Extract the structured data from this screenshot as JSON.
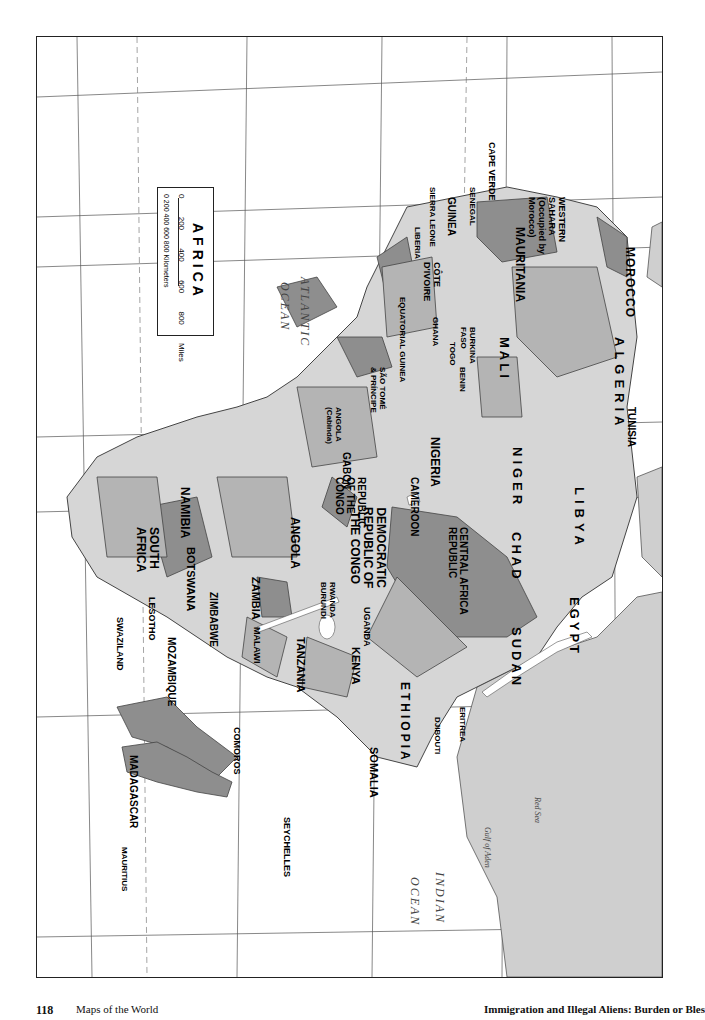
{
  "page": {
    "number": "118",
    "section_title": "Maps of the World",
    "book_title": "Immigration and Illegal Aliens: Burden or Bles"
  },
  "map": {
    "title": "AFRICA",
    "orientation": "rotated 90° clockwise",
    "scale": {
      "miles_ticks": [
        "0",
        "200",
        "400",
        "600",
        "800 Miles"
      ],
      "km_ticks": [
        "0",
        "200",
        "400",
        "600",
        "800 Kilometers"
      ]
    },
    "oceans": {
      "atlantic_1": "ATLANTIC",
      "atlantic_2": "OCEAN",
      "indian_1": "INDIAN",
      "indian_2": "OCEAN"
    },
    "water_bodies": {
      "red_sea": "Red Sea",
      "gulf_of_aden": "Gulf of Aden",
      "mozambique_channel_1": "Mozambique",
      "mozambique_channel_2": "Channel",
      "suez": "Suez Canal",
      "lake_chad": "Lake Chad",
      "lake_victoria": "Lake Victoria",
      "lake_tanganyika": "Lake Tanganyika",
      "lake_malawi": "Lake Malawi",
      "lake_turkana": "Lake Turkana",
      "lake_nasser": "Lake Nasser"
    },
    "lines": {
      "tropic_cancer": "Tropic of Cancer",
      "equator": "Equator",
      "tropic_capricorn": "Tropic of Capricorn"
    },
    "countries": {
      "morocco": "MOROCCO",
      "western_sahara_1": "WESTERN",
      "western_sahara_2": "SAHARA",
      "western_sahara_3": "(Occupied by",
      "western_sahara_4": "Morocco)",
      "algeria": "ALGERIA",
      "tunisia": "TUNISIA",
      "libya": "LIBYA",
      "egypt": "EGYPT",
      "mauritania": "MAURITANIA",
      "mali": "MALI",
      "niger": "NIGER",
      "chad": "CHAD",
      "sudan": "SUDAN",
      "cape_verde": "CAPE VERDE",
      "senegal": "SENEGAL",
      "gambia_1": "THE",
      "gambia_2": "GAMBIA",
      "guinea_bissau_1": "GUINEA-",
      "guinea_bissau_2": "BISSAU",
      "guinea": "GUINEA",
      "sierra_leone": "SIERRA LEONE",
      "liberia": "LIBERIA",
      "cote_divoire_1": "CÔTE",
      "cote_divoire_2": "D'IVOIRE",
      "burkina_1": "BURKINA",
      "burkina_2": "FASO",
      "ghana": "GHANA",
      "togo": "TOGO",
      "benin": "BENIN",
      "nigeria": "NIGERIA",
      "cameroon": "CAMEROON",
      "car_1": "CENTRAL AFRICA",
      "car_2": "REPUBLIC",
      "eq_guinea": "EQUATORIAL GUINEA",
      "sao_tome_1": "SÃO TOMÉ",
      "sao_tome_2": "& PRÍNCIPE",
      "gabon": "GABON",
      "congo_1": "REPUBLIC",
      "congo_2": "OF THE",
      "congo_3": "CONGO",
      "drc_1": "DEMOCRATIC",
      "drc_2": "REPUBLIC OF",
      "drc_3": "THE CONGO",
      "cabinda_1": "ANGOLA",
      "cabinda_2": "(Cabinda)",
      "angola": "ANGOLA",
      "namibia": "NAMIBIA",
      "botswana": "BOTSWANA",
      "zambia": "ZAMBIA",
      "zimbabwe": "ZIMBABWE",
      "malawi": "MALAWI",
      "mozambique": "MOZAMBIQUE",
      "south_africa_1": "SOUTH",
      "south_africa_2": "AFRICA",
      "lesotho": "LESOTHO",
      "swaziland": "SWAZILAND",
      "madagascar": "MADAGASCAR",
      "tanzania": "TANZANIA",
      "kenya": "KENYA",
      "uganda": "UGANDA",
      "rwanda": "RWANDA",
      "burundi": "BURUNDI",
      "ethiopia": "ETHIOPIA",
      "eritrea": "ERITREA",
      "djibouti": "DJIBOUTI",
      "somalia": "SOMALIA",
      "comoros": "COMOROS",
      "seychelles": "SEYCHELLES",
      "mauritius": "MAURITIUS"
    },
    "cities": {
      "rabat": "Rabat",
      "marrakesh": "Marrakesh",
      "oran": "Oran",
      "algiers": "Algiers",
      "tunis": "Tunis",
      "tripoli": "Tripoli",
      "tamanrasset": "Tamanrasset",
      "sebha": "Sebha",
      "al_jawf": "Al Jawf",
      "tobruk": "Tobruk",
      "alexandria": "Alexandria",
      "cairo": "Cairo",
      "aswan": "Aswan",
      "nouakchott": "Nouakchott",
      "nema": "Néma",
      "chegga": "Chegga",
      "smara": "Smara",
      "dakar": "Dakar",
      "banjul": "Banjul",
      "bissau": "Bissau",
      "conakry": "Conakry",
      "freetown": "Freetown",
      "monrovia": "Monrovia",
      "bamako": "Bamako",
      "tombouctou": "Tombouctou",
      "ouagadougou": "Ouagadougou",
      "yamoussoukro": "Yamoussoukro",
      "abidjan": "Abidjan",
      "accra": "Accra",
      "lome": "Lomé",
      "porto_novo": "Porto-Novo",
      "tagalla": "Tagalla",
      "niamey": "Niamey",
      "agadez": "Agadez",
      "zinder": "Zinder",
      "kano": "Kano",
      "maiduguri": "Maiduguri",
      "abuja": "Abuja",
      "faya_largeau": "Faya-Largeau",
      "ndjamena": "N'Djamena",
      "bousso": "Bousso",
      "douala": "Douala",
      "yaounde": "Yaoundé",
      "bangui": "Bangui",
      "birao": "Birao",
      "malabo": "Malabo",
      "bata": "Bata",
      "libreville": "Libreville",
      "sao_tome": "São Tomé",
      "brazzaville": "Brazzaville",
      "kinshasa": "Kinshasa",
      "kisangani": "Kisangani",
      "kananga": "Kananga",
      "lubumbashi": "Lubumbashi",
      "luanda": "Luanda",
      "benguela": "Benguela",
      "lobito": "Lobito",
      "menongue": "Menongue",
      "windhoek": "Windhoek",
      "walvis_bay": "Walvis Bay",
      "luderitz": "Lüderitz",
      "gaborone": "Gaborone",
      "maun": "Maun",
      "lusaka": "Lusaka",
      "kitwe": "Kitwe",
      "harare": "Harare",
      "bulawayo": "Bulawayo",
      "lilongwe": "Lilongwe",
      "pretoria": "Pretoria",
      "johannesburg": "Johannesburg",
      "maseru": "Maseru",
      "mbabane": "Mbabane",
      "maputo": "Maputo",
      "inhambane": "Inhambane",
      "nampula": "Nampula",
      "cape_town": "Cape Town",
      "port_elizabeth": "Port Elizabeth",
      "khartoum": "Khartoum",
      "nyala": "Nyala",
      "juba": "Juba",
      "port_sudan": "Port Sudan",
      "asmara": "Asmara",
      "addis_ababa": "Addis Ababa",
      "djibouti_city": "Djibouti",
      "kampala": "Kampala",
      "kigali": "Kigali",
      "bujumbura": "Bujumbura",
      "nairobi": "Nairobi",
      "dodoma": "Dodoma",
      "dar_es_salaam": "Dar es Salaam",
      "mogadishu": "Mogadishu",
      "hargeysa": "Hargeysa",
      "moroni": "Moroni",
      "dzaoudzi": "Dzaoudzi",
      "antananarivo": "Antananarivo",
      "toliara": "Toliara",
      "mahajanga": "Mahajanga",
      "antsiranana": "Antsiranana",
      "victoria": "Victoria",
      "port_louis": "Port Louis",
      "st_denis": "St.-Denis",
      "praia": "Praia"
    },
    "territories": {
      "madeira": "Madeira Is. (PORTUGAL)",
      "canary": "Canary Is. (SPAIN)",
      "ascension": "Ascension (UK)",
      "st_helena": "St. Helena (UK)",
      "annobon": "Annobón (EQ. GUINEA)",
      "pemba": "Pemba I.",
      "zanzibar": "Zanzibar I.",
      "mafia": "Mafia I.",
      "mayotte": "Mayotte (FRANCE)",
      "juan_de_nova": "Juan de Nova (FRANCE)",
      "bassas": "Bassas da India (FRANCE)",
      "europa": "Europa I. (FRANCE)",
      "glorieuses": "Iles Glorieuses (FRANCE)",
      "tromelin": "Tromelin (FRANCE)",
      "reunion": "Réunion (FRENCH AFRICAN DEPENDENCY)",
      "agalega": "Agalega Is. (MAURITIUS)",
      "cargados": "Cargados Carajos Shoals (MAURITIUS)"
    },
    "region_colors": {
      "light": "#d6d6d6",
      "medium": "#b4b4b4",
      "dark": "#8e8e8e",
      "water": "#ffffff",
      "outside_land": "#cfcfcf"
    }
  }
}
